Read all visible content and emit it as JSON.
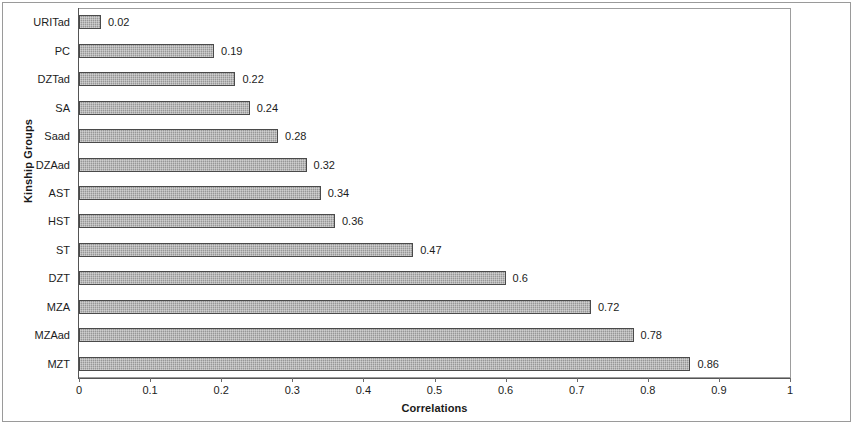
{
  "chart_data": {
    "type": "bar",
    "orientation": "horizontal",
    "title": "",
    "xlabel": "Correlations",
    "ylabel": "Kinship Groups",
    "xlim": [
      0,
      1
    ],
    "xticks": [
      "0",
      "0.1",
      "0.2",
      "0.3",
      "0.4",
      "0.5",
      "0.6",
      "0.7",
      "0.8",
      "0.9",
      "1"
    ],
    "xtick_values": [
      0,
      0.1,
      0.2,
      0.3,
      0.4,
      0.5,
      0.6,
      0.7,
      0.8,
      0.9,
      1
    ],
    "grid": false,
    "legend": false,
    "categories": [
      "URITad",
      "PC",
      "DZTad",
      "SA",
      "Saad",
      "DZAad",
      "AST",
      "HST",
      "ST",
      "DZT",
      "MZA",
      "MZAad",
      "MZT"
    ],
    "values": [
      0.02,
      0.19,
      0.22,
      0.24,
      0.28,
      0.32,
      0.34,
      0.36,
      0.47,
      0.6,
      0.72,
      0.78,
      0.86
    ],
    "value_labels": [
      "0.02",
      "0.19",
      "0.22",
      "0.24",
      "0.28",
      "0.32",
      "0.34",
      "0.36",
      "0.47",
      "0.6",
      "0.72",
      "0.78",
      "0.86"
    ],
    "series": [
      {
        "name": "Correlations",
        "values": [
          0.02,
          0.19,
          0.22,
          0.24,
          0.28,
          0.32,
          0.34,
          0.36,
          0.47,
          0.6,
          0.72,
          0.78,
          0.86
        ]
      }
    ],
    "bar_fill_color": "#a0a0a0",
    "bar_border_color": "#4a4a4a",
    "axis_color": "#555555",
    "text_color": "#1c1c1c"
  }
}
